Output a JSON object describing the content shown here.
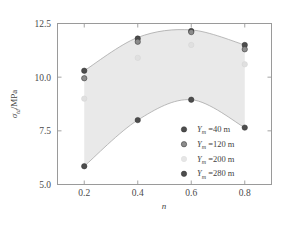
{
  "chart_data": {
    "type": "scatter",
    "title": "",
    "xlabel": "n",
    "ylabel": "σ_td/MPa",
    "xlim": [
      0.1,
      0.9
    ],
    "ylim": [
      5.0,
      12.5
    ],
    "xticks": [
      "0.2",
      "0.4",
      "0.6",
      "0.8"
    ],
    "xtick_values": [
      0.2,
      0.4,
      0.6,
      0.8
    ],
    "yticks": [
      "5.0",
      "7.5",
      "10.0",
      "12.5"
    ],
    "ytick_values": [
      5.0,
      7.5,
      10.0,
      12.5
    ],
    "grid": false,
    "legend_position": "lower right",
    "x": [
      0.2,
      0.4,
      0.6,
      0.8
    ],
    "series": [
      {
        "name": "Y_m =40 m",
        "values": [
          10.3,
          11.8,
          12.15,
          11.5
        ],
        "color": "#4d4d4d"
      },
      {
        "name": "Y_m =120 m",
        "values": [
          9.95,
          11.65,
          12.1,
          11.3
        ],
        "color": "#8c8c8c"
      },
      {
        "name": "Y_m =200 m",
        "values": [
          9.0,
          10.9,
          11.5,
          10.6
        ],
        "color": "#e0e0e0"
      },
      {
        "name": "Y_m =280 m",
        "values": [
          5.85,
          8.0,
          8.95,
          7.65
        ],
        "color": "#4d4d4d"
      }
    ],
    "band": {
      "fill_color": "#e9e9e9",
      "edge_color": "#aaaaaa",
      "upper_values": [
        10.3,
        11.85,
        12.2,
        11.5
      ],
      "lower_values": [
        5.85,
        8.0,
        8.95,
        7.65
      ]
    }
  },
  "axes": {
    "y_label_sigma": "σ",
    "y_label_sub": "td",
    "y_label_unit": "/MPa",
    "x_label": "n",
    "ytick_0": "5.0",
    "ytick_1": "7.5",
    "ytick_2": "10.0",
    "ytick_3": "12.5",
    "xtick_0": "0.2",
    "xtick_1": "0.4",
    "xtick_2": "0.6",
    "xtick_3": "0.8"
  },
  "legend": {
    "items": [
      {
        "symbol": "Y",
        "sub": "m",
        "value": " =40 m",
        "color": "#4d4d4d"
      },
      {
        "symbol": "Y",
        "sub": "m",
        "value": " =120 m",
        "color": "#8c8c8c"
      },
      {
        "symbol": "Y",
        "sub": "m",
        "value": " =200 m",
        "color": "#e6e6e6"
      },
      {
        "symbol": "Y",
        "sub": "m",
        "value": " =280 m",
        "color": "#4d4d4d"
      }
    ]
  }
}
